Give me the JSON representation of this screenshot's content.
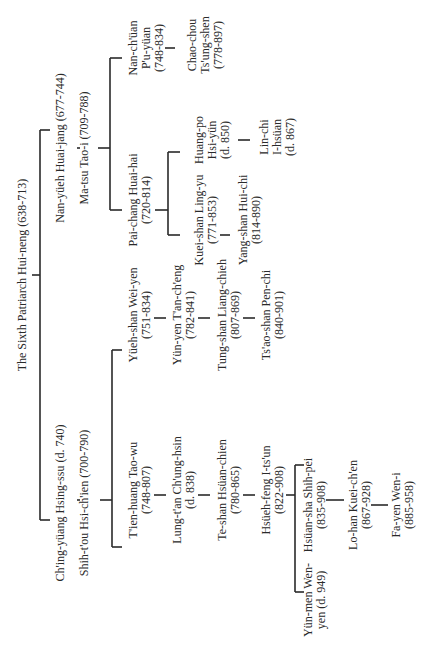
{
  "diagram": {
    "type": "lineage-tree",
    "orientation": "rotated-90-ccw",
    "nodes": {
      "huineng": [
        "The Sixth Patriarch Hui-neng (638-713)"
      ],
      "huaijang": [
        "Nan-yüeh Huai-jang (677-744)"
      ],
      "taoi": [
        "Ma-tsu Tao-i (709-788)"
      ],
      "puyuan": [
        "Nan-ch'üan",
        "P'u-yüan",
        "(748-834)"
      ],
      "tsungshen": [
        "Chao-chou",
        "Ts'ung-shen",
        "(778-897)"
      ],
      "huaihai": [
        "Pai-chang Huai-hai",
        "(720-814)"
      ],
      "lingyu": [
        "Kuei-shan Ling-yu",
        "(771-853)"
      ],
      "huichi": [
        "Yang-shan Hui-chi",
        "(814-890)"
      ],
      "hsiyun": [
        "Huang-po",
        "Hsi-yün",
        "(d. 850)"
      ],
      "ihsuan": [
        "Lin-chi",
        "I-hsüan",
        "(d. 867)"
      ],
      "hsingssu": [
        "Ch'ing-yüang Hsing-ssu (d. 740)"
      ],
      "hsichien": [
        "Shih-t'ou Hsi-ch'ien (700-790)"
      ],
      "weiyen": [
        "Yüeh-shan Wei-yen",
        "(751-834)"
      ],
      "tancheng": [
        "Yün-yen T'an-ch'eng",
        "(782-841)"
      ],
      "liangchieh": [
        "Tung-shan Liang-chieh",
        "(807-869)"
      ],
      "penchi": [
        "Ts'ao-shan Pen-chi",
        "(840-901)"
      ],
      "taowu": [
        "T'ien-huang Tao-wu",
        "(748-807)"
      ],
      "chunghsin": [
        "Lung-t'an Ch'ung-hsin",
        "(d. 838)"
      ],
      "hsuanchien": [
        "Te-shan Hsüan-chien",
        "(780-865)"
      ],
      "itsun": [
        "Hsüeh-feng I-ts'un",
        "(822-908)"
      ],
      "wenyen": [
        "Yün-men Wen-",
        "yen (d. 949)"
      ],
      "shihpei": [
        "Hsüan-sha Shih-pei",
        "(835-908)"
      ],
      "kueichen": [
        "Lo-han Kuei-ch'en",
        "(867-928)"
      ],
      "weni": [
        "Fa-yen Wen-i",
        "(885-958)"
      ]
    },
    "edges": [
      [
        "huineng",
        "huaijang"
      ],
      [
        "huineng",
        "hsingssu"
      ],
      [
        "huaijang",
        "taoi"
      ],
      [
        "taoi",
        "puyuan"
      ],
      [
        "taoi",
        "huaihai"
      ],
      [
        "puyuan",
        "tsungshen"
      ],
      [
        "huaihai",
        "lingyu"
      ],
      [
        "huaihai",
        "hsiyun"
      ],
      [
        "lingyu",
        "huichi"
      ],
      [
        "hsiyun",
        "ihsuan"
      ],
      [
        "hsingssu",
        "hsichien"
      ],
      [
        "hsichien",
        "weiyen"
      ],
      [
        "hsichien",
        "taowu"
      ],
      [
        "weiyen",
        "tancheng"
      ],
      [
        "tancheng",
        "liangchieh"
      ],
      [
        "liangchieh",
        "penchi"
      ],
      [
        "taowu",
        "chunghsin"
      ],
      [
        "chunghsin",
        "hsuanchien"
      ],
      [
        "hsuanchien",
        "itsun"
      ],
      [
        "itsun",
        "wenyen"
      ],
      [
        "itsun",
        "shihpei"
      ],
      [
        "shihpei",
        "kueichen"
      ],
      [
        "kueichen",
        "weni"
      ]
    ]
  }
}
